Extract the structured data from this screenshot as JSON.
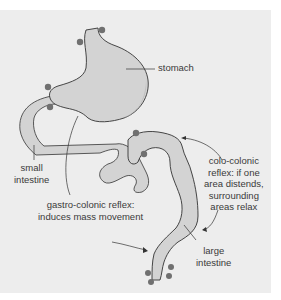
{
  "figure": {
    "background": "#ededed",
    "organ_fill": "#d3d3d3",
    "organ_shade": "#bdbdbd",
    "outline": "#333333",
    "dot_color": "#707070",
    "labels": {
      "stomach": "stomach",
      "small_intestine": "small\nintestine",
      "gastro_colonic": "gastro-colonic reflex:\ninduces mass movement",
      "colo_colonic": "colo-colonic\nreflex: if one\narea distends,\nsurrounding\nareas relax",
      "large_intestine": "large\nintestine"
    }
  }
}
